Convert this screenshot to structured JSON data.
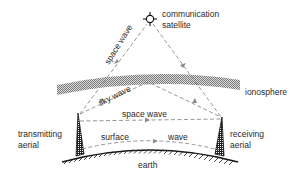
{
  "diagram": {
    "labels": {
      "satellite_line1": "communication",
      "satellite_line2": "satellite",
      "ionosphere": "ionosphere",
      "space_wave_satellite": "space wave",
      "sky_wave": "sky wave",
      "space_wave_direct": "space wave",
      "surface": "surface",
      "wave": "wave",
      "transmitting_line1": "transmitting",
      "transmitting_line2": "aerial",
      "receiving_line1": "receiving",
      "receiving_line2": "aerial",
      "earth": "earth"
    },
    "nodes": [
      {
        "id": "satellite",
        "label": "communication satellite"
      },
      {
        "id": "ionosphere",
        "label": "ionosphere"
      },
      {
        "id": "transmitting-aerial",
        "label": "transmitting aerial"
      },
      {
        "id": "receiving-aerial",
        "label": "receiving aerial"
      },
      {
        "id": "earth",
        "label": "earth"
      }
    ],
    "paths": [
      {
        "name": "space wave",
        "from": "transmitting-aerial",
        "to": "receiving-aerial",
        "via": "satellite"
      },
      {
        "name": "sky wave",
        "from": "transmitting-aerial",
        "to": "receiving-aerial",
        "via": "ionosphere"
      },
      {
        "name": "space wave",
        "from": "transmitting-aerial",
        "to": "receiving-aerial",
        "via": "direct"
      },
      {
        "name": "surface wave",
        "from": "transmitting-aerial",
        "to": "receiving-aerial",
        "via": "earth surface"
      }
    ],
    "colors": {
      "line": "#8a8a8a",
      "text": "#2a2a2a",
      "hatch": "#1a1a1a"
    }
  }
}
